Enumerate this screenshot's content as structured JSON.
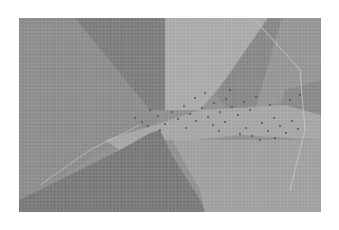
{
  "chart_data": {
    "type": "heatmap",
    "title": "",
    "xlabel": "",
    "ylabel": "",
    "grid": true,
    "legend": null,
    "plot_area": {
      "x": 19,
      "y": 18,
      "width": 302,
      "height": 194
    },
    "grid_cell_px": 3.5,
    "background_color": "#8e8e8e",
    "regions": [
      {
        "name": "left-region",
        "color": "#8a8a8a",
        "points": [
          [
            19,
            18
          ],
          [
            75,
            18
          ],
          [
            160,
            120
          ],
          [
            19,
            200
          ]
        ]
      },
      {
        "name": "upper-dark-wedge",
        "color": "#7a7a7a",
        "points": [
          [
            75,
            18
          ],
          [
            165,
            18
          ],
          [
            165,
            110
          ],
          [
            150,
            110
          ]
        ]
      },
      {
        "name": "upper-center-light",
        "color": "#a8a8a8",
        "points": [
          [
            165,
            18
          ],
          [
            268,
            18
          ],
          [
            225,
            80
          ],
          [
            200,
            110
          ],
          [
            165,
            110
          ]
        ]
      },
      {
        "name": "upper-right-dark-band",
        "color": "#858585",
        "points": [
          [
            268,
            18
          ],
          [
            282,
            18
          ],
          [
            255,
            110
          ],
          [
            230,
            110
          ],
          [
            215,
            95
          ]
        ]
      },
      {
        "name": "upper-right-region",
        "color": "#939393",
        "points": [
          [
            282,
            18
          ],
          [
            321,
            18
          ],
          [
            321,
            90
          ],
          [
            285,
            100
          ],
          [
            255,
            110
          ]
        ]
      },
      {
        "name": "right-mid-dark",
        "color": "#868686",
        "points": [
          [
            285,
            90
          ],
          [
            321,
            80
          ],
          [
            321,
            115
          ],
          [
            280,
            110
          ]
        ]
      },
      {
        "name": "center-light-band",
        "color": "#a4a4a4",
        "points": [
          [
            105,
            140
          ],
          [
            155,
            125
          ],
          [
            200,
            110
          ],
          [
            285,
            105
          ],
          [
            321,
            115
          ],
          [
            321,
            140
          ],
          [
            240,
            135
          ],
          [
            195,
            140
          ],
          [
            160,
            140
          ],
          [
            120,
            150
          ]
        ]
      },
      {
        "name": "lower-dark-triangle",
        "color": "#767676",
        "points": [
          [
            19,
            212
          ],
          [
            19,
            200
          ],
          [
            120,
            150
          ],
          [
            150,
            133
          ],
          [
            160,
            130
          ],
          [
            172,
            155
          ],
          [
            200,
            200
          ],
          [
            205,
            212
          ]
        ]
      },
      {
        "name": "lower-right-light",
        "color": "#9e9e9e",
        "points": [
          [
            172,
            140
          ],
          [
            321,
            140
          ],
          [
            321,
            212
          ],
          [
            205,
            212
          ],
          [
            200,
            190
          ]
        ]
      }
    ],
    "scatter_points": [
      [
        135,
        118
      ],
      [
        142,
        122
      ],
      [
        150,
        110
      ],
      [
        158,
        116
      ],
      [
        165,
        124
      ],
      [
        172,
        112
      ],
      [
        178,
        119
      ],
      [
        184,
        106
      ],
      [
        190,
        114
      ],
      [
        196,
        121
      ],
      [
        202,
        108
      ],
      [
        208,
        117
      ],
      [
        214,
        103
      ],
      [
        220,
        112
      ],
      [
        226,
        99
      ],
      [
        232,
        107
      ],
      [
        238,
        115
      ],
      [
        244,
        102
      ],
      [
        250,
        110
      ],
      [
        256,
        97
      ],
      [
        262,
        123
      ],
      [
        268,
        131
      ],
      [
        274,
        118
      ],
      [
        280,
        126
      ],
      [
        286,
        133
      ],
      [
        292,
        121
      ],
      [
        298,
        129
      ],
      [
        246,
        128
      ],
      [
        252,
        136
      ],
      [
        240,
        134
      ],
      [
        213,
        125
      ],
      [
        219,
        131
      ],
      [
        225,
        122
      ],
      [
        160,
        130
      ],
      [
        148,
        126
      ],
      [
        186,
        128
      ],
      [
        195,
        98
      ],
      [
        205,
        93
      ],
      [
        230,
        90
      ],
      [
        270,
        105
      ],
      [
        290,
        100
      ],
      [
        300,
        95
      ],
      [
        260,
        140
      ],
      [
        275,
        138
      ]
    ],
    "scatter_color": "#4a4a4a",
    "curves": [
      {
        "name": "right-arc",
        "color": "#c8c8c8",
        "points": [
          [
            255,
            20
          ],
          [
            300,
            70
          ],
          [
            305,
            130
          ],
          [
            290,
            190
          ]
        ]
      },
      {
        "name": "left-arc",
        "color": "#bdbdbd",
        "points": [
          [
            40,
            185
          ],
          [
            90,
            150
          ],
          [
            140,
            125
          ]
        ]
      }
    ]
  }
}
